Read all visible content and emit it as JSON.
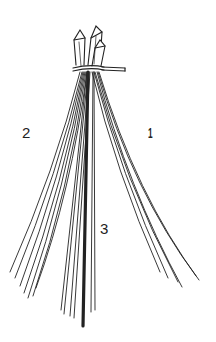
{
  "figure": {
    "labels": {
      "bundle_1": "1",
      "bundle_2": "2",
      "bundle_3": "3"
    },
    "colors": {
      "ink": "#222222",
      "background": "#ffffff"
    }
  }
}
